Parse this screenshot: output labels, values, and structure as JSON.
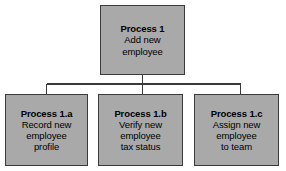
{
  "diagram": {
    "type": "process-hierarchy-tree",
    "background_color": "#ffffff",
    "node_fill_color": "#a9a9a9",
    "node_border_color": "#3a3a3a",
    "connector_color": "#3a3a3a",
    "text_color": "#000000",
    "root": {
      "id": "process-1",
      "title": "Process 1",
      "description_lines": [
        "Add new",
        "employee"
      ],
      "description": "Add new employee"
    },
    "children": [
      {
        "id": "process-1a",
        "title": "Process 1.a",
        "description_lines": [
          "Record new",
          "employee",
          "profile"
        ],
        "description": "Record new employee profile"
      },
      {
        "id": "process-1b",
        "title": "Process 1.b",
        "description_lines": [
          "Verify new",
          "employee",
          "tax status"
        ],
        "description": "Verify new employee tax status"
      },
      {
        "id": "process-1c",
        "title": "Process 1.c",
        "description_lines": [
          "Assign new",
          "employee",
          "to team"
        ],
        "description": "Assign new employee to team"
      }
    ]
  }
}
